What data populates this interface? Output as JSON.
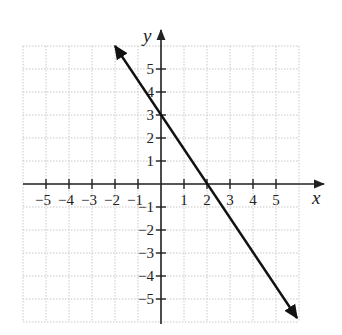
{
  "chart_data": {
    "type": "line",
    "title": "",
    "xlabel": "x",
    "ylabel": "y",
    "xlim": [
      -6,
      6
    ],
    "ylim": [
      -6,
      6
    ],
    "grid": true,
    "grid_style": "dotted",
    "x_ticks": [
      -5,
      -4,
      -3,
      -2,
      -1,
      1,
      2,
      3,
      4,
      5
    ],
    "y_ticks": [
      -5,
      -4,
      -3,
      -2,
      -1,
      1,
      2,
      3,
      4,
      5
    ],
    "x_tick_labels": [
      "−5",
      "−4",
      "−3",
      "−2",
      "−1",
      "1",
      "2",
      "3",
      "4",
      "5"
    ],
    "y_tick_labels": [
      "−5",
      "−4",
      "−3",
      "−2",
      "−1",
      "1",
      "2",
      "3",
      "4",
      "5"
    ],
    "series": [
      {
        "name": "line",
        "equation": "y = -1.5x + 3",
        "slope": -1.5,
        "y_intercept": 3,
        "x_intercept": 2,
        "x": [
          -2,
          0,
          2,
          6
        ],
        "y": [
          6,
          3,
          0,
          -6
        ],
        "arrows_both_ends": true,
        "color": "#111111"
      }
    ],
    "legend": null
  },
  "axes": {
    "x_label": "x",
    "y_label": "y",
    "color": "#222222",
    "grid_color": "#c8c8c8"
  }
}
